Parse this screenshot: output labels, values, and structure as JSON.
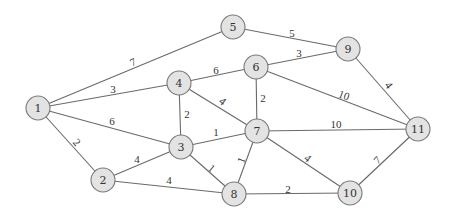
{
  "diagram": {
    "type": "weighted-undirected-graph",
    "node_radius": 12,
    "colors": {
      "node_fill": "#e3e3e3",
      "node_stroke": "#7a7a7a",
      "edge": "#6a6a6a",
      "text": "#333333"
    },
    "nodes": [
      {
        "id": "1",
        "label": "1",
        "x": 38,
        "y": 108
      },
      {
        "id": "2",
        "label": "2",
        "x": 103,
        "y": 180
      },
      {
        "id": "3",
        "label": "3",
        "x": 181,
        "y": 147
      },
      {
        "id": "4",
        "label": "4",
        "x": 179,
        "y": 83
      },
      {
        "id": "5",
        "label": "5",
        "x": 233,
        "y": 27
      },
      {
        "id": "6",
        "label": "6",
        "x": 256,
        "y": 67
      },
      {
        "id": "7",
        "label": "7",
        "x": 257,
        "y": 131
      },
      {
        "id": "8",
        "label": "8",
        "x": 234,
        "y": 194
      },
      {
        "id": "9",
        "label": "9",
        "x": 348,
        "y": 49
      },
      {
        "id": "10",
        "label": "10",
        "x": 350,
        "y": 193
      },
      {
        "id": "11",
        "label": "11",
        "x": 418,
        "y": 129
      }
    ],
    "edges": [
      {
        "from": "1",
        "to": "5",
        "weight": "7",
        "lx": 133,
        "ly": 62,
        "rot": -27
      },
      {
        "from": "1",
        "to": "4",
        "weight": "3",
        "lx": 113,
        "ly": 89,
        "rot": 0
      },
      {
        "from": "1",
        "to": "3",
        "weight": "6",
        "lx": 112,
        "ly": 121,
        "rot": 0
      },
      {
        "from": "1",
        "to": "2",
        "weight": "2",
        "lx": 77,
        "ly": 142,
        "rot": 48
      },
      {
        "from": "2",
        "to": "3",
        "weight": "4",
        "lx": 137,
        "ly": 159,
        "rot": 0
      },
      {
        "from": "2",
        "to": "8",
        "weight": "4",
        "lx": 169,
        "ly": 180,
        "rot": 0
      },
      {
        "from": "3",
        "to": "4",
        "weight": "2",
        "lx": 187,
        "ly": 114,
        "rot": 0
      },
      {
        "from": "3",
        "to": "7",
        "weight": "1",
        "lx": 216,
        "ly": 132,
        "rot": 0
      },
      {
        "from": "3",
        "to": "8",
        "weight": "1",
        "lx": 212,
        "ly": 168,
        "rot": 40
      },
      {
        "from": "4",
        "to": "6",
        "weight": "6",
        "lx": 216,
        "ly": 70,
        "rot": 0
      },
      {
        "from": "4",
        "to": "7",
        "weight": "4",
        "lx": 223,
        "ly": 101,
        "rot": 38
      },
      {
        "from": "5",
        "to": "9",
        "weight": "5",
        "lx": 292,
        "ly": 33,
        "rot": 0
      },
      {
        "from": "6",
        "to": "9",
        "weight": "3",
        "lx": 299,
        "ly": 53,
        "rot": 0
      },
      {
        "from": "6",
        "to": "7",
        "weight": "2",
        "lx": 263,
        "ly": 98,
        "rot": 0
      },
      {
        "from": "6",
        "to": "11",
        "weight": "10",
        "lx": 344,
        "ly": 95,
        "rot": 20
      },
      {
        "from": "9",
        "to": "11",
        "weight": "4",
        "lx": 389,
        "ly": 85,
        "rot": 52
      },
      {
        "from": "7",
        "to": "11",
        "weight": "10",
        "lx": 336,
        "ly": 124,
        "rot": 0
      },
      {
        "from": "7",
        "to": "8",
        "weight": "1",
        "lx": 241,
        "ly": 160,
        "rot": -70
      },
      {
        "from": "7",
        "to": "10",
        "weight": "4",
        "lx": 308,
        "ly": 158,
        "rot": 40
      },
      {
        "from": "8",
        "to": "10",
        "weight": "2",
        "lx": 288,
        "ly": 189,
        "rot": 0
      },
      {
        "from": "10",
        "to": "11",
        "weight": "7",
        "lx": 377,
        "ly": 160,
        "rot": -45
      }
    ]
  }
}
